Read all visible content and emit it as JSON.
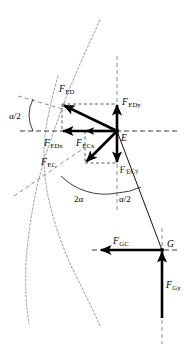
{
  "figure": {
    "type": "free-body-force-diagram",
    "background_color": "#ffffff",
    "line_color": "#000000",
    "contour_color": "#9a9a9a"
  },
  "points": [
    {
      "id": "E",
      "label": "E",
      "x": 117,
      "y": 131
    },
    {
      "id": "G",
      "label": "G",
      "x": 162,
      "y": 250
    }
  ],
  "forces": [
    {
      "id": "F_ED",
      "base": "F",
      "sub": "ED",
      "label_x": 59,
      "label_y": 92,
      "from_x": 117,
      "from_y": 131,
      "to_x": 62,
      "to_y": 104,
      "direction": "upper-left",
      "origin": "E"
    },
    {
      "id": "F_EDx",
      "base": "F",
      "sub": "EDx",
      "label_x": 48,
      "label_y": 144,
      "from_x": 117,
      "from_y": 131,
      "to_x": 62,
      "to_y": 131,
      "direction": "left",
      "origin": "E"
    },
    {
      "id": "F_ECx",
      "base": "F",
      "sub": "ECx",
      "label_x": 78,
      "label_y": 144,
      "from_x": 117,
      "from_y": 131,
      "to_x": 85,
      "to_y": 131,
      "direction": "left",
      "origin": "E"
    },
    {
      "id": "F_EC",
      "base": "F",
      "sub": "EC",
      "label_x": 43,
      "label_y": 163,
      "from_x": 117,
      "from_y": 131,
      "to_x": 85,
      "to_y": 163,
      "direction": "lower-left",
      "origin": "E"
    },
    {
      "id": "F_EDy",
      "base": "F",
      "sub": "EDy",
      "label_x": 121,
      "label_y": 104,
      "from_x": 117,
      "from_y": 131,
      "to_x": 117,
      "to_y": 104,
      "direction": "up",
      "origin": "E"
    },
    {
      "id": "F_ECy",
      "base": "F",
      "sub": "ECy",
      "label_x": 119,
      "label_y": 172,
      "from_x": 117,
      "from_y": 131,
      "to_x": 117,
      "to_y": 163,
      "direction": "down",
      "origin": "E"
    },
    {
      "id": "F_GC",
      "base": "F",
      "sub": "GC",
      "label_x": 117,
      "label_y": 243,
      "from_x": 162,
      "from_y": 250,
      "to_x": 100,
      "to_y": 250,
      "direction": "left",
      "origin": "G"
    },
    {
      "id": "F_Gy",
      "base": "F",
      "sub": "Gy",
      "label_x": 166,
      "label_y": 290,
      "from_x": 162,
      "from_y": 318,
      "to_x": 162,
      "to_y": 250,
      "direction": "up",
      "origin": "G"
    }
  ],
  "angles": [
    {
      "id": "alpha-half-top-left",
      "label": "α/2",
      "x": 11,
      "y": 116
    },
    {
      "id": "two-alpha",
      "label": "2α",
      "x": 78,
      "y": 199
    },
    {
      "id": "alpha-half-bottom",
      "label": "α/2",
      "x": 121,
      "y": 199
    }
  ],
  "labels": {
    "point_E": "E",
    "point_G": "G"
  }
}
